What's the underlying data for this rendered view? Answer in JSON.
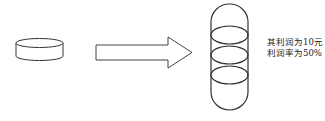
{
  "diagram": {
    "source": {
      "label": "single-cylinder",
      "shape": "cylinder"
    },
    "arrow": {
      "direction": "right",
      "shape": "block-arrow"
    },
    "target": {
      "label": "stacked-cylinder",
      "shape": "stacked-discs",
      "disc_count": 4
    },
    "annotation": {
      "line1": "其利润为10元",
      "line2": "利润率为50%"
    },
    "colors": {
      "stroke": "#333333",
      "fill": "#ffffff",
      "text": "#222222"
    }
  }
}
